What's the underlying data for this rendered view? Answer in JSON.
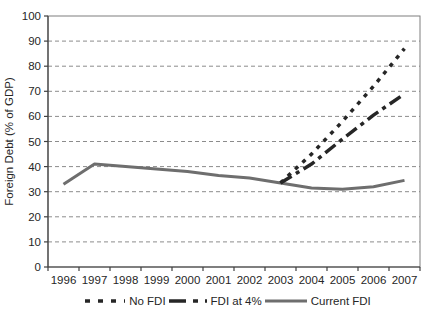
{
  "chart_data": {
    "type": "line",
    "title": "",
    "xlabel": "",
    "ylabel": "Foreign Debt (% of GDP)",
    "x": [
      "1996",
      "1997",
      "1998",
      "1999",
      "2000",
      "2001",
      "2002",
      "2003",
      "2004",
      "2005",
      "2006",
      "2007"
    ],
    "ylim": [
      0,
      100
    ],
    "ytick_step": 10,
    "grid": "horizontal-dashed",
    "legend_position": "bottom",
    "colors": {
      "projection_line": "#262626",
      "current_line": "#6e6e6e",
      "gridline": "#8c8c8c",
      "axis": "#404040",
      "border": "#7f7f7f",
      "text": "#262626"
    },
    "series": [
      {
        "name": "No FDI",
        "style": "dotted",
        "color": "#262626",
        "values": [
          null,
          null,
          null,
          null,
          null,
          null,
          null,
          33.5,
          45,
          58,
          72,
          87
        ]
      },
      {
        "name": "FDI at 4%",
        "style": "long-dash",
        "color": "#262626",
        "values": [
          null,
          null,
          null,
          null,
          null,
          null,
          null,
          33.5,
          41,
          51,
          60.5,
          69
        ]
      },
      {
        "name": "Current FDI",
        "style": "solid",
        "color": "#6e6e6e",
        "values": [
          33,
          41,
          40,
          39,
          38,
          36.5,
          35.5,
          33.5,
          31.5,
          31,
          32,
          34.5
        ]
      }
    ]
  }
}
